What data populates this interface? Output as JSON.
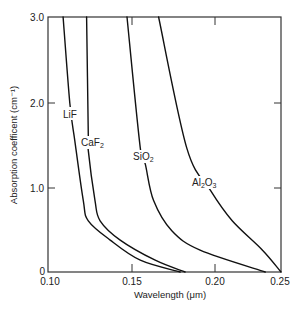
{
  "chart_data": {
    "type": "line",
    "title": "",
    "xlabel": "Wavelength (μm)",
    "ylabel": "Absorption coefficent (cm⁻¹)",
    "xlim": [
      0.1,
      0.25
    ],
    "ylim": [
      0,
      3.0
    ],
    "grid": false,
    "legend": "none (curves labeled inline)",
    "x_ticks": [
      {
        "value": 0.1,
        "label": "0.10"
      },
      {
        "value": 0.15,
        "label": "0.15"
      },
      {
        "value": 0.2,
        "label": "0.20"
      },
      {
        "value": 0.25,
        "label": "0.25"
      }
    ],
    "y_ticks": [
      {
        "value": 0,
        "label": "0"
      },
      {
        "value": 1.0,
        "label": "1.0"
      },
      {
        "value": 2.0,
        "label": "2.0"
      },
      {
        "value": 3.0,
        "label": "3.0"
      }
    ],
    "series": [
      {
        "name": "LiF",
        "label_main": "LiF",
        "label_sub": "",
        "x": [
          0.109,
          0.113,
          0.116,
          0.121,
          0.124,
          0.137,
          0.155,
          0.179
        ],
        "y": [
          3.0,
          2.0,
          1.55,
          0.85,
          0.61,
          0.38,
          0.14,
          0.0
        ]
      },
      {
        "name": "CaF2",
        "label_main": "CaF",
        "label_sub": "2",
        "x": [
          0.123,
          0.124,
          0.124,
          0.128,
          0.131,
          0.143,
          0.164,
          0.182
        ],
        "y": [
          3.0,
          1.61,
          1.44,
          0.85,
          0.61,
          0.38,
          0.14,
          0.0
        ]
      },
      {
        "name": "SiO2",
        "label_main": "SiO",
        "label_sub": "2",
        "x": [
          0.147,
          0.155,
          0.158,
          0.163,
          0.174,
          0.191,
          0.238
        ],
        "y": [
          3.0,
          1.47,
          1.28,
          0.85,
          0.49,
          0.26,
          0.0
        ]
      },
      {
        "name": "Al2O3",
        "label_main": "Al",
        "label_sub": "2",
        "label_main2": "O",
        "label_sub2": "3",
        "x": [
          0.166,
          0.183,
          0.197,
          0.213,
          0.236,
          0.25
        ],
        "y": [
          3.0,
          1.47,
          0.98,
          0.61,
          0.26,
          0.0
        ]
      }
    ]
  }
}
